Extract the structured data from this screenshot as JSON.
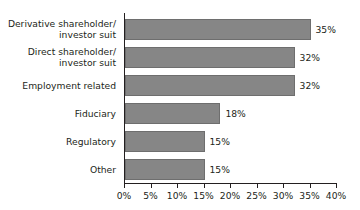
{
  "chart_data": {
    "type": "bar",
    "orientation": "horizontal",
    "title": "",
    "xlabel": "",
    "ylabel": "",
    "xlim": [
      0,
      40
    ],
    "xticks": [
      0,
      5,
      10,
      15,
      20,
      25,
      30,
      35,
      40
    ],
    "xtick_labels": [
      "0%",
      "5%",
      "10%",
      "15%",
      "20%",
      "25%",
      "30%",
      "35%",
      "40%"
    ],
    "grid": false,
    "legend": null,
    "value_suffix": "%",
    "bar_color": "#868686",
    "bar_border_color": "#6e6e6e",
    "axis_color": "#231f20",
    "background_color": "#ffffff",
    "categories": [
      "Derivative shareholder/\ninvestor suit",
      "Direct shareholder/\ninvestor suit",
      "Employment related",
      "Fiduciary",
      "Regulatory",
      "Other"
    ],
    "values": [
      35,
      32,
      32,
      18,
      15,
      15
    ],
    "data_labels": [
      "35%",
      "32%",
      "32%",
      "18%",
      "15%",
      "15%"
    ]
  }
}
